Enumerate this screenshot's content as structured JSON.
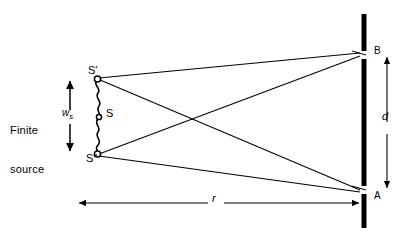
{
  "figure": {
    "background_color": "#ffffff",
    "stroke_color": "#000000"
  },
  "labels": {
    "finite_source_line1": "Finite",
    "finite_source_line2": "source",
    "source_width_symbol": "w",
    "source_width_subscript": "s",
    "source_top": "S′",
    "source_center": "S",
    "source_bottom": "S″",
    "point_top": "B",
    "point_bottom": "A",
    "separation_symbol": "d",
    "distance_symbol": "r"
  },
  "geometry": {
    "source_x": 97,
    "source_top_y": 78,
    "source_center_y": 116,
    "source_bottom_y": 155,
    "barrier_x": 364,
    "barrier_top_y": 14,
    "barrier_bottom_y": 228,
    "point_b_y": 55,
    "point_a_y": 190,
    "gap_half_height": 4,
    "ws_arrow_x": 70,
    "ws_arrow_top_y": 80,
    "ws_arrow_bottom_y": 152,
    "d_arrow_x": 387,
    "r_arrow_y": 203,
    "r_arrow_left_x": 78,
    "r_arrow_right_x": 360
  },
  "rays": [
    {
      "name": "s-prime-to-b",
      "from": "S′",
      "to": "B"
    },
    {
      "name": "s-prime-to-a",
      "from": "S′",
      "to": "A"
    },
    {
      "name": "s-double-prime-to-b",
      "from": "S″",
      "to": "B"
    },
    {
      "name": "s-double-prime-to-a",
      "from": "S″",
      "to": "A"
    }
  ]
}
